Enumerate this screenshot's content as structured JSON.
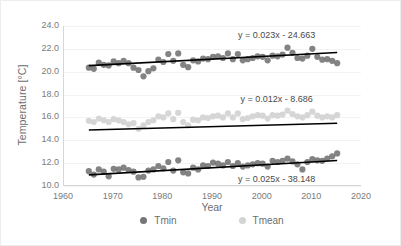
{
  "chart_data": {
    "type": "scatter",
    "title": "",
    "xlabel": "Year",
    "ylabel": "Temperature [°C]",
    "xlim": [
      1960,
      2020
    ],
    "ylim": [
      10.0,
      24.0
    ],
    "xticks": [
      1960,
      1970,
      1980,
      1990,
      2000,
      2010,
      2020
    ],
    "xtick_labels": [
      "1960",
      "1970",
      "1980",
      "1990",
      "2000",
      "2010",
      "2020"
    ],
    "yticks": [
      10.0,
      12.0,
      14.0,
      16.0,
      18.0,
      20.0,
      22.0,
      24.0
    ],
    "ytick_labels": [
      "10.0",
      "12.0",
      "14.0",
      "16.0",
      "18.0",
      "20.0",
      "22.0",
      "24.0"
    ],
    "grid": true,
    "grid_axis": "y",
    "legend_position": "bottom",
    "legend": [
      "Tmin",
      "Tmean"
    ],
    "colors": {
      "tmax_series": "#767676",
      "tmin_series": "#767676",
      "tmean_series": "#d4d4d4",
      "trendline": "#000000",
      "gridline": "#f3f3f3",
      "axis": "#d6d6d6",
      "tick_text": "#7b7b7b",
      "axis_title": "#6d6d6d",
      "equation_text": "#4a4a4a",
      "background": "#ffffff"
    },
    "series": [
      {
        "name": "Tmax",
        "marker_color": "#767676",
        "x": [
          1965,
          1966,
          1967,
          1968,
          1969,
          1970,
          1971,
          1972,
          1973,
          1974,
          1975,
          1976,
          1977,
          1978,
          1979,
          1980,
          1981,
          1982,
          1983,
          1984,
          1985,
          1986,
          1987,
          1988,
          1989,
          1990,
          1991,
          1992,
          1993,
          1994,
          1995,
          1996,
          1997,
          1998,
          1999,
          2000,
          2001,
          2002,
          2003,
          2004,
          2005,
          2006,
          2007,
          2008,
          2009,
          2010,
          2011,
          2012,
          2013,
          2014,
          2015
        ],
        "values": [
          20.35,
          20.25,
          20.8,
          20.6,
          20.55,
          20.9,
          20.75,
          20.95,
          20.75,
          20.35,
          20.15,
          19.6,
          20.05,
          20.3,
          21.05,
          20.85,
          21.55,
          20.95,
          21.6,
          20.6,
          20.4,
          21.0,
          20.9,
          21.15,
          21.1,
          21.3,
          21.35,
          21.2,
          21.6,
          21.1,
          21.55,
          21.0,
          21.1,
          21.2,
          21.35,
          21.3,
          21.0,
          21.4,
          21.35,
          21.5,
          22.1,
          21.65,
          21.2,
          21.15,
          21.4,
          22.0,
          21.3,
          21.05,
          21.1,
          20.95,
          20.75
        ]
      },
      {
        "name": "Tmean",
        "marker_color": "#d4d4d4",
        "x": [
          1965,
          1966,
          1967,
          1968,
          1969,
          1970,
          1971,
          1972,
          1973,
          1974,
          1975,
          1976,
          1977,
          1978,
          1979,
          1980,
          1981,
          1982,
          1983,
          1984,
          1985,
          1986,
          1987,
          1988,
          1989,
          1990,
          1991,
          1992,
          1993,
          1994,
          1995,
          1996,
          1997,
          1998,
          1999,
          2000,
          2001,
          2002,
          2003,
          2004,
          2005,
          2006,
          2007,
          2008,
          2009,
          2010,
          2011,
          2012,
          2013,
          2014,
          2015
        ],
        "values": [
          15.7,
          15.6,
          15.9,
          15.75,
          15.6,
          15.85,
          15.75,
          15.6,
          15.4,
          15.5,
          15.0,
          15.3,
          15.6,
          15.75,
          16.1,
          16.0,
          16.35,
          15.85,
          16.4,
          15.6,
          15.3,
          15.8,
          15.75,
          16.0,
          15.95,
          16.1,
          16.15,
          16.0,
          16.35,
          16.0,
          16.35,
          15.85,
          15.95,
          16.1,
          16.2,
          16.15,
          15.9,
          16.2,
          16.15,
          16.25,
          16.6,
          16.3,
          16.1,
          16.0,
          16.2,
          16.5,
          16.15,
          16.0,
          16.1,
          16.0,
          16.2
        ]
      },
      {
        "name": "Tmin",
        "marker_color": "#767676",
        "x": [
          1965,
          1966,
          1967,
          1968,
          1969,
          1970,
          1971,
          1972,
          1973,
          1974,
          1975,
          1976,
          1977,
          1978,
          1979,
          1980,
          1981,
          1982,
          1983,
          1984,
          1985,
          1986,
          1987,
          1988,
          1989,
          1990,
          1991,
          1992,
          1993,
          1994,
          1995,
          1996,
          1997,
          1998,
          1999,
          2000,
          2001,
          2002,
          2003,
          2004,
          2005,
          2006,
          2007,
          2008,
          2009,
          2010,
          2011,
          2012,
          2013,
          2014,
          2015
        ],
        "values": [
          11.3,
          11.0,
          11.45,
          11.25,
          10.85,
          11.5,
          11.45,
          11.6,
          11.4,
          11.25,
          10.75,
          10.8,
          11.35,
          11.45,
          11.75,
          11.55,
          12.1,
          11.35,
          12.25,
          11.2,
          11.1,
          11.6,
          11.45,
          11.8,
          11.75,
          12.05,
          11.95,
          11.8,
          12.1,
          11.75,
          12.0,
          11.7,
          11.8,
          11.9,
          12.0,
          11.95,
          11.7,
          12.2,
          12.1,
          12.2,
          12.4,
          12.15,
          11.9,
          11.45,
          12.1,
          12.35,
          12.25,
          12.2,
          12.4,
          12.6,
          12.85
        ]
      }
    ],
    "trendlines": [
      {
        "series": "Tmax",
        "equation": "y = 0.023x - 24.663",
        "slope": 0.023,
        "intercept": -24.663,
        "x_start": 1965,
        "x_end": 2015,
        "label_x": 2003,
        "label_y": 23.15
      },
      {
        "series": "Tmean",
        "equation": "y = 0.012x - 8.686",
        "slope": 0.012,
        "intercept": -8.686,
        "x_start": 1965,
        "x_end": 2015,
        "label_x": 2003,
        "label_y": 17.55
      },
      {
        "series": "Tmin",
        "equation": "y = 0.025x - 38.148",
        "slope": 0.025,
        "intercept": -38.148,
        "x_start": 1965,
        "x_end": 2015,
        "label_x": 2003,
        "label_y": 10.55
      }
    ]
  }
}
